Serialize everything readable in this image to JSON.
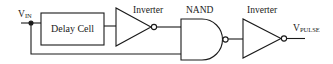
{
  "diagram": {
    "stroke_color": "#1a1a1a",
    "background": "#ffffff",
    "input": {
      "label_main": "V",
      "label_sub": "IN"
    },
    "output": {
      "label_main": "V",
      "label_sub": "PULSE"
    },
    "blocks": [
      {
        "id": "delay",
        "type": "box",
        "label": "Delay Cell"
      },
      {
        "id": "inv1",
        "type": "inverter",
        "label": "Inverter"
      },
      {
        "id": "nand",
        "type": "nand",
        "label": "NAND"
      },
      {
        "id": "inv2",
        "type": "inverter",
        "label": "Inverter"
      }
    ],
    "connections": [
      [
        "VIN",
        "delay"
      ],
      [
        "delay",
        "inv1"
      ],
      [
        "inv1",
        "nand.in1"
      ],
      [
        "VIN",
        "nand.in2"
      ],
      [
        "nand",
        "inv2"
      ],
      [
        "inv2",
        "VPULSE"
      ]
    ]
  }
}
